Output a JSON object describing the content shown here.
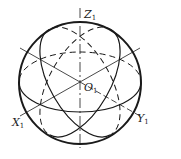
{
  "diagram": {
    "type": "isometric sphere projection",
    "center_label": {
      "main": "O",
      "sub": "1"
    },
    "axes": [
      {
        "name": "z-axis",
        "label": {
          "main": "Z",
          "sub": "1"
        }
      },
      {
        "name": "x-axis",
        "label": {
          "main": "X",
          "sub": "1"
        }
      },
      {
        "name": "y-axis",
        "label": {
          "main": "Y",
          "sub": "1"
        }
      }
    ],
    "colors": {
      "stroke": "#1a1a1a",
      "background": "#ffffff"
    }
  }
}
